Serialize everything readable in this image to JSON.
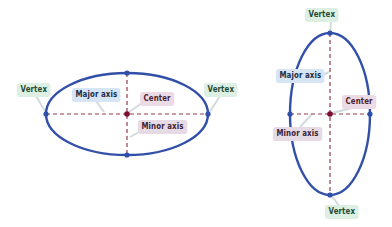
{
  "colors": {
    "ellipse_stroke": "#3350a8",
    "axis_dash": "#9a3a4a",
    "center_point": "#7a1030",
    "vertex_point": "#2f4fa8",
    "leader": "#d0d6dc",
    "vertex_label_bg": "#dcefe2",
    "major_label_bg": "#d5e5f4",
    "center_label_bg": "#ecdbe4",
    "minor_label_bg": "#e6dae4"
  },
  "horizontal_ellipse": {
    "orientation": "horizontal",
    "labels": {
      "vertex_left": "Vertex",
      "vertex_right": "Vertex",
      "major_axis": "Major axis",
      "center": "Center",
      "minor_axis": "Minor axis"
    }
  },
  "vertical_ellipse": {
    "orientation": "vertical",
    "labels": {
      "vertex_top": "Vertex",
      "vertex_bottom": "Vertex",
      "major_axis": "Major axis",
      "center": "Center",
      "minor_axis": "Minor axis"
    }
  }
}
